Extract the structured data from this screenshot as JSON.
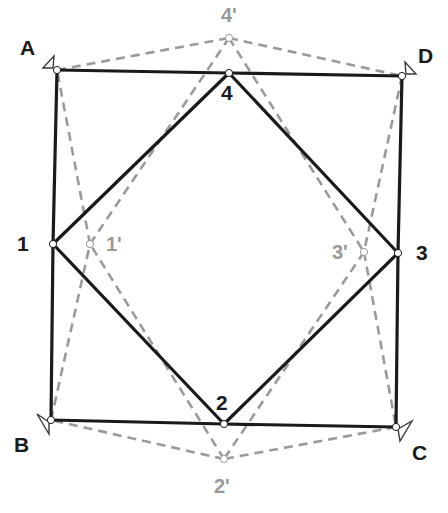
{
  "diagram": {
    "colors": {
      "solid": "#1a1a1a",
      "dashed": "#9a9a9a",
      "background": "#ffffff"
    },
    "corners": [
      {
        "id": "A",
        "label": "A",
        "x": 57,
        "y": 70,
        "label_x": 20,
        "label_y": 55
      },
      {
        "id": "B",
        "label": "B",
        "x": 51,
        "y": 420,
        "label_x": 14,
        "label_y": 452
      },
      {
        "id": "C",
        "label": "C",
        "x": 396,
        "y": 427,
        "label_x": 412,
        "label_y": 460
      },
      {
        "id": "D",
        "label": "D",
        "x": 402,
        "y": 76,
        "label_x": 418,
        "label_y": 63
      }
    ],
    "points": [
      {
        "id": "1",
        "label": "1",
        "x": 53,
        "y": 244,
        "label_x": 17,
        "label_y": 251
      },
      {
        "id": "2",
        "label": "2",
        "x": 224,
        "y": 424,
        "label_x": 216,
        "label_y": 410
      },
      {
        "id": "3",
        "label": "3",
        "x": 398,
        "y": 253,
        "label_x": 416,
        "label_y": 260
      },
      {
        "id": "4",
        "label": "4",
        "x": 229,
        "y": 73,
        "label_x": 221,
        "label_y": 100
      }
    ],
    "primed_points": [
      {
        "id": "1p",
        "label": "1'",
        "x": 90,
        "y": 244,
        "label_x": 106,
        "label_y": 251
      },
      {
        "id": "2p",
        "label": "2'",
        "x": 224,
        "y": 459,
        "label_x": 214,
        "label_y": 493
      },
      {
        "id": "3p",
        "label": "3'",
        "x": 364,
        "y": 252,
        "label_x": 332,
        "label_y": 259
      },
      {
        "id": "4p",
        "label": "4'",
        "x": 229,
        "y": 38,
        "label_x": 221,
        "label_y": 22
      }
    ],
    "solid_edges": [
      [
        "A",
        "4"
      ],
      [
        "4",
        "D"
      ],
      [
        "D",
        "3"
      ],
      [
        "3",
        "C"
      ],
      [
        "C",
        "2"
      ],
      [
        "2",
        "B"
      ],
      [
        "B",
        "1"
      ],
      [
        "1",
        "A"
      ],
      [
        "1",
        "4"
      ],
      [
        "4",
        "3"
      ],
      [
        "3",
        "2"
      ],
      [
        "2",
        "1"
      ]
    ],
    "dashed_edges": [
      [
        "A",
        "4p"
      ],
      [
        "4p",
        "D"
      ],
      [
        "D",
        "3p"
      ],
      [
        "3p",
        "C"
      ],
      [
        "C",
        "2p"
      ],
      [
        "2p",
        "B"
      ],
      [
        "B",
        "1p"
      ],
      [
        "1p",
        "A"
      ],
      [
        "1p",
        "4p"
      ],
      [
        "4p",
        "3p"
      ],
      [
        "3p",
        "2p"
      ],
      [
        "2p",
        "1p"
      ]
    ]
  }
}
